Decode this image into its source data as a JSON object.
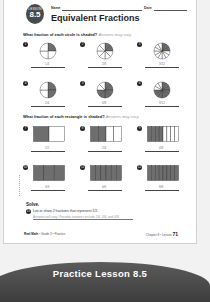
{
  "worksheet": {
    "lesson_label": "LESSON",
    "lesson_number": "8.5",
    "name_label": "Name",
    "date_label": "Date",
    "title": "Equivalent Fractions",
    "section1": {
      "prompt": "What fraction of each circle is shaded?",
      "hint": "Answers may vary.",
      "items": [
        {
          "number": "1",
          "shape": "circle",
          "parts": 4,
          "shaded": 1
        },
        {
          "number": "2",
          "shape": "circle",
          "parts": 8,
          "shaded": 2
        },
        {
          "number": "3",
          "shape": "circle",
          "parts": 12,
          "shaded": 3
        },
        {
          "number": "4",
          "shape": "circle",
          "parts": 4,
          "shaded": 2
        },
        {
          "number": "5",
          "shape": "circle",
          "parts": 8,
          "shaded": 6
        },
        {
          "number": "6",
          "shape": "circle",
          "parts": 12,
          "shaded": 9
        }
      ]
    },
    "section2": {
      "prompt": "What fraction of each rectangle is shaded?",
      "hint": "Answers may vary.",
      "items": [
        {
          "number": "7",
          "shape": "rect",
          "parts": 2,
          "shaded": 1
        },
        {
          "number": "8",
          "shape": "rect",
          "parts": 4,
          "shaded": 2
        },
        {
          "number": "9",
          "shape": "rect",
          "parts": 8,
          "shaded": 4
        },
        {
          "number": "10",
          "shape": "rect",
          "parts": 3,
          "shaded": 3
        },
        {
          "number": "11",
          "shape": "rect",
          "parts": 6,
          "shaded": 6
        },
        {
          "number": "12",
          "shape": "rect",
          "parts": 8,
          "shaded": 8
        }
      ]
    },
    "solve": {
      "heading": "Solve.",
      "number": "13",
      "question": "List or show 2 fractions that represent 1/2.",
      "answer": "Answers will vary. Possible answers include 2/4, 3/6, and 4/8."
    },
    "footer": {
      "left_brand": "Real Math",
      "left_rest": " • Grade 3 • Practice",
      "right_text": "Chapter 8 • Lesson ",
      "page_number": "71"
    }
  },
  "banner": {
    "text": "Practice Lesson 8.5"
  },
  "colors": {
    "shade": "#6e6e6e",
    "badge": "#4a4a4a",
    "banner": "#4a4a4a"
  }
}
